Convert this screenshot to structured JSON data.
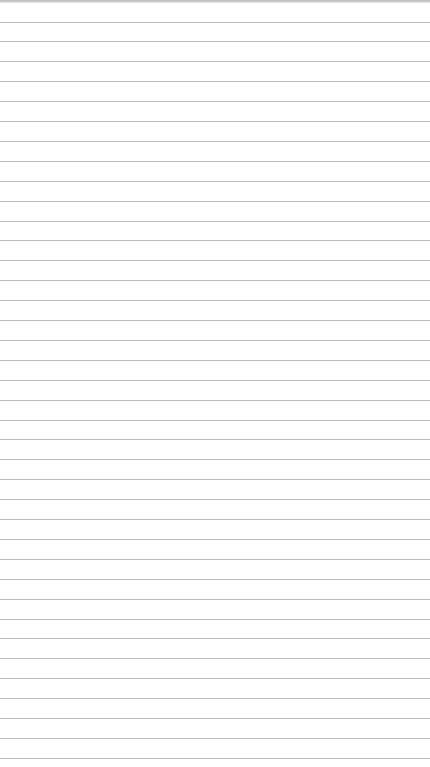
{
  "page": {
    "type": "lined-paper",
    "background_color": "#ffffff",
    "line_color": "#bdbdbd",
    "top_strip_color": "#b9b9b9",
    "first_line_y": 21.5,
    "line_spacing": 19.9,
    "line_count": 38
  }
}
